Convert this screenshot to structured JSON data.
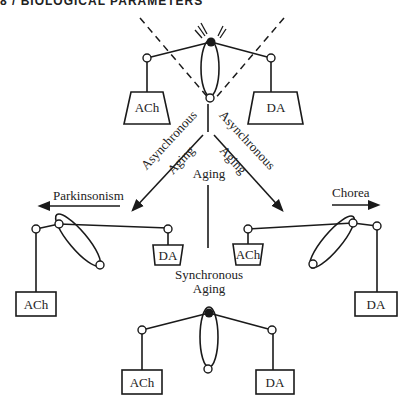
{
  "header": {
    "running_title": "8 / BIOLOGICAL PARAMETERS"
  },
  "diagram": {
    "top_balance": {
      "left_weight": "ACh",
      "right_weight": "DA",
      "state": "balanced"
    },
    "branches": [
      {
        "id": "left",
        "line1": "Asynchronous",
        "line2": "Aging",
        "outcome": "Parkinsonism"
      },
      {
        "id": "center",
        "line1": "Aging"
      },
      {
        "id": "right",
        "line1": "Asynchronous",
        "line2": "Aging",
        "outcome": "Chorea"
      }
    ],
    "left_balance": {
      "left_weight": "ACh",
      "right_weight": "DA",
      "state": "tilted toward ACh"
    },
    "right_balance": {
      "left_weight": "ACh",
      "right_weight": "DA",
      "state": "tilted toward DA"
    },
    "bottom_balance": {
      "title_line1": "Synchronous",
      "title_line2": "Aging",
      "left_weight": "ACh",
      "right_weight": "DA",
      "state": "balanced"
    }
  },
  "colors": {
    "ink": "#1a1a1a",
    "background": "#ffffff"
  }
}
